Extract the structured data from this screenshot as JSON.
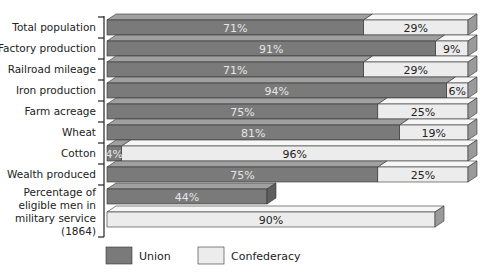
{
  "chart_data": {
    "type": "bar",
    "orientation": "horizontal",
    "stacked": true,
    "title": "",
    "xlabel": "",
    "ylabel": "",
    "xlim": [
      0,
      100
    ],
    "grid": false,
    "legend_position": "bottom",
    "categories": [
      [
        "Total population"
      ],
      [
        "Factory production"
      ],
      [
        "Railroad mileage"
      ],
      [
        "Iron production"
      ],
      [
        "Farm acreage"
      ],
      [
        "Wheat"
      ],
      [
        "Cotton"
      ],
      [
        "Wealth produced"
      ],
      [
        "Percentage of",
        "eligible men in",
        "military service",
        "(1864)"
      ]
    ],
    "series": [
      {
        "name": "Union",
        "color": "#7a7a7a",
        "values": [
          71,
          91,
          71,
          94,
          75,
          81,
          4,
          75,
          44
        ]
      },
      {
        "name": "Confederacy",
        "color": "#e8e8e8",
        "values": [
          29,
          9,
          29,
          6,
          25,
          19,
          96,
          25,
          90
        ]
      }
    ],
    "split_last_category": true
  },
  "legend": {
    "union_label": "Union",
    "confederacy_label": "Confederacy"
  },
  "colors": {
    "union_front": "#7a7a7a",
    "union_top": "#a0a0a0",
    "union_side": "#5e5e5e",
    "conf_front": "#ececec",
    "conf_top": "#f6f6f6",
    "conf_side": "#9a9a9a",
    "edge": "#333333"
  }
}
